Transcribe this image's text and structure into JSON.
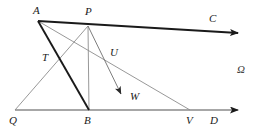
{
  "figure": {
    "name": "geometry-diagram",
    "width": 266,
    "height": 137,
    "background": "#ffffff"
  },
  "colors": {
    "stroke_dark": "#1a1a1a",
    "stroke_thin": "#8c8c8c",
    "stroke_base": "#8a8a8a",
    "label_text": "#1a1a1a",
    "omega_text": "#3a3a3a"
  },
  "points": {
    "A": {
      "label": "A",
      "x": 38,
      "y": 21,
      "label_x": 33,
      "label_y": 6
    },
    "P": {
      "label": "P",
      "x": 88,
      "y": 26,
      "label_x": 85,
      "label_y": 7
    },
    "C": {
      "label": "C",
      "x": 240,
      "y": 33,
      "label_x": 210,
      "label_y": 14
    },
    "T": {
      "label": "T",
      "x": 57,
      "y": 62,
      "label_x": 43,
      "label_y": 53
    },
    "U": {
      "label": "U",
      "x": 110,
      "y": 62,
      "label_x": 110,
      "label_y": 48
    },
    "W": {
      "label": "W",
      "x": 122,
      "y": 95,
      "label_x": 131,
      "label_y": 93
    },
    "Q": {
      "label": "Q",
      "x": 15,
      "y": 110,
      "label_x": 10,
      "label_y": 116
    },
    "B": {
      "label": "B",
      "x": 89,
      "y": 110,
      "label_x": 85,
      "label_y": 116
    },
    "V": {
      "label": "V",
      "x": 190,
      "y": 110,
      "label_x": 186,
      "label_y": 116
    },
    "D": {
      "label": "D",
      "x": 240,
      "y": 110,
      "label_x": 211,
      "label_y": 116
    },
    "Omega": {
      "label": "Ω",
      "x": 243,
      "y": 72,
      "label_x": 237,
      "label_y": 65
    }
  },
  "segments": [
    {
      "name": "segment-A-to-C-ray",
      "from": "A",
      "to": "C",
      "style": "thick-dark",
      "arrow": true
    },
    {
      "name": "segment-A-to-B",
      "from": "A",
      "to": "B",
      "style": "thick-dark",
      "arrow": false
    },
    {
      "name": "segment-A-to-V",
      "from": "A",
      "to": "V",
      "style": "thin-gray",
      "arrow": false
    },
    {
      "name": "segment-Q-to-P",
      "from": "Q",
      "to": "P",
      "style": "thin-gray",
      "arrow": false
    },
    {
      "name": "segment-P-to-W-ray",
      "from": "P",
      "to": "W",
      "style": "thin-gray",
      "arrow": true
    },
    {
      "name": "segment-P-to-B",
      "from": "P",
      "to": "B",
      "style": "thin-gray",
      "arrow": false
    },
    {
      "name": "segment-Q-to-D-baseline",
      "from": "Q",
      "to": "D",
      "style": "base-gray",
      "arrow": true
    }
  ],
  "labels": [
    {
      "name": "label-A",
      "text": "A"
    },
    {
      "name": "label-P",
      "text": "P"
    },
    {
      "name": "label-C",
      "text": "C"
    },
    {
      "name": "label-T",
      "text": "T"
    },
    {
      "name": "label-U",
      "text": "U"
    },
    {
      "name": "label-W",
      "text": "W"
    },
    {
      "name": "label-Q",
      "text": "Q"
    },
    {
      "name": "label-B",
      "text": "B"
    },
    {
      "name": "label-V",
      "text": "V"
    },
    {
      "name": "label-D",
      "text": "D"
    },
    {
      "name": "label-omega",
      "text": "Ω"
    }
  ]
}
